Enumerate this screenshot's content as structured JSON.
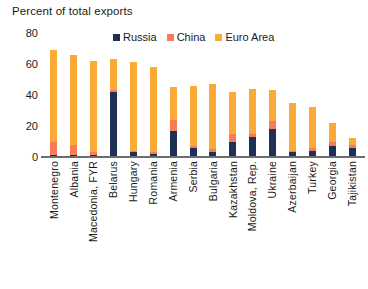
{
  "chart_data": {
    "type": "bar",
    "subtype": "stacked-column",
    "title": "Percent of total exports",
    "xlabel": "",
    "ylabel": "",
    "ylim": [
      0,
      80
    ],
    "yticks": [
      0,
      20,
      40,
      60,
      80
    ],
    "grid": false,
    "legend_position": "top-right",
    "categories": [
      "Montenegro",
      "Albania",
      "Macedonia, FYR",
      "Belarus",
      "Hungary",
      "Romania",
      "Armenia",
      "Serbia",
      "Bulgaria",
      "Kazakhstan",
      "Moldova, Rep.",
      "Ukraine",
      "Azerbaijan",
      "Turkey",
      "Georgia",
      "Tajikistan"
    ],
    "series": [
      {
        "name": "Russia",
        "color": "#1f3057",
        "values": [
          1,
          1,
          1,
          42,
          3,
          2,
          17,
          6,
          3,
          10,
          13,
          18,
          3,
          4,
          7,
          6
        ]
      },
      {
        "name": "China",
        "color": "#f87b59",
        "values": [
          9,
          7,
          2,
          1,
          1,
          1,
          7,
          1,
          2,
          5,
          2,
          5,
          1,
          2,
          3,
          2
        ]
      },
      {
        "name": "Euro Area",
        "color": "#fba937",
        "values": [
          59,
          58,
          59,
          20,
          57,
          55,
          21,
          39,
          42,
          27,
          29,
          20,
          31,
          26,
          12,
          4
        ]
      }
    ],
    "totals": [
      69,
      66,
      62,
      63,
      61,
      58,
      45,
      46,
      47,
      42,
      44,
      43,
      35,
      32,
      22,
      12
    ]
  },
  "legend": {
    "entries": [
      {
        "label": "Russia",
        "color": "#1f3057"
      },
      {
        "label": "China",
        "color": "#f87b59"
      },
      {
        "label": "Euro Area",
        "color": "#fba937"
      }
    ]
  }
}
